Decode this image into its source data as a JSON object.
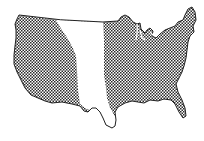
{
  "map": {
    "subject": "Contiguous United States",
    "style": "crosshatched fill with unshaded central band",
    "colors": {
      "background": "#ffffff",
      "outline": "#222222",
      "hatch": "#333333",
      "band": "#ffffff"
    },
    "regions": [
      {
        "name": "western-region",
        "fill": "crosshatch"
      },
      {
        "name": "central-plains-band",
        "fill": "none"
      },
      {
        "name": "eastern-region",
        "fill": "crosshatch"
      }
    ]
  }
}
